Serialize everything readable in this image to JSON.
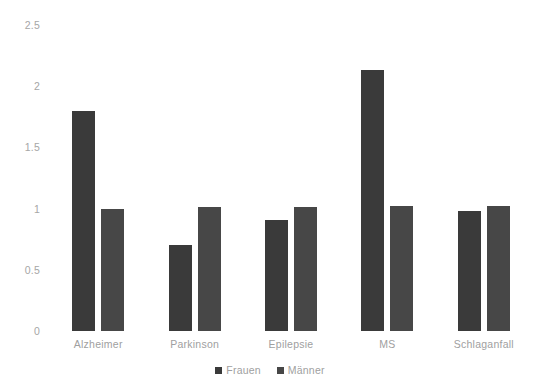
{
  "chart_data": {
    "type": "bar",
    "title": "",
    "subtitle": "",
    "xlabel": "",
    "ylabel": "",
    "categories": [
      "Alzheimer",
      "Parkinson",
      "Epilepsie",
      "MS",
      "Schlaganfall"
    ],
    "series": [
      {
        "name": "Frauen",
        "values": [
          1.8,
          0.7,
          0.91,
          2.13,
          0.98
        ],
        "color": "#3a3a3a"
      },
      {
        "name": "Männer",
        "values": [
          1.0,
          1.01,
          1.01,
          1.02,
          1.02
        ],
        "color": "#474747"
      }
    ],
    "ylim": [
      0,
      2.5
    ],
    "ytick_step": 0.5,
    "yticks": [
      "0",
      "0.5",
      "1",
      "1.5",
      "2",
      "2.5"
    ],
    "ytick_values": [
      0,
      0.5,
      1,
      1.5,
      2,
      2.5
    ],
    "grid": false,
    "legend_position": "bottom",
    "background_color": "#ffffff",
    "tick_label_color": "#a0a0a0"
  }
}
